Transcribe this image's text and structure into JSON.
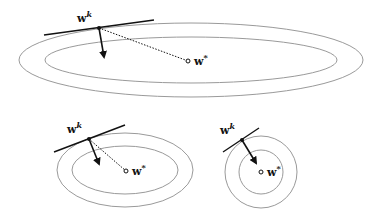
{
  "figure": {
    "colors": {
      "contour": "#9a9a9a",
      "ink": "#111111",
      "background": "#ffffff"
    },
    "panels": [
      {
        "id": "elongated",
        "contours": [
          {
            "cx": 191,
            "cy": 60,
            "rx": 172,
            "ry": 37
          },
          {
            "cx": 191,
            "cy": 60,
            "rx": 146,
            "ry": 23
          }
        ],
        "wk": {
          "x": 99,
          "y": 28,
          "label": "w",
          "sup": "k"
        },
        "tangent": {
          "x1": 44,
          "y1": 35,
          "x2": 154,
          "y2": 20
        },
        "gradient_arrow": {
          "x2": 104,
          "y2": 57
        },
        "wstar": {
          "x": 188,
          "y": 61,
          "label": "w",
          "sup": "*"
        }
      },
      {
        "id": "moderate",
        "contours": [
          {
            "cx": 125,
            "cy": 170,
            "rx": 68,
            "ry": 37
          },
          {
            "cx": 125,
            "cy": 170,
            "rx": 53,
            "ry": 24
          }
        ],
        "wk": {
          "x": 89,
          "y": 139,
          "label": "w",
          "sup": "k"
        },
        "tangent": {
          "x1": 54,
          "y1": 152,
          "x2": 125,
          "y2": 125
        },
        "gradient_arrow": {
          "x2": 99,
          "y2": 164
        },
        "wstar": {
          "x": 126,
          "y": 171,
          "label": "w",
          "sup": "*"
        }
      },
      {
        "id": "circular",
        "contours": [
          {
            "cx": 261,
            "cy": 172,
            "rx": 36,
            "ry": 36
          },
          {
            "cx": 261,
            "cy": 172,
            "rx": 22,
            "ry": 22
          }
        ],
        "wk": {
          "x": 242,
          "y": 140,
          "label": "w",
          "sup": "k"
        },
        "tangent": {
          "x1": 223,
          "y1": 152,
          "x2": 259,
          "y2": 128
        },
        "gradient_arrow": {
          "x2": 256,
          "y2": 163
        },
        "wstar": {
          "x": 261,
          "y": 172,
          "label": "w",
          "sup": "*"
        }
      }
    ]
  }
}
